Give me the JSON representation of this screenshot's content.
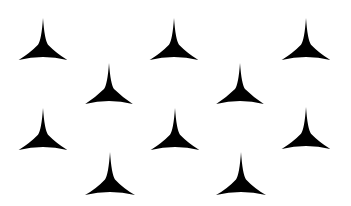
{
  "canvas": {
    "width": 351,
    "height": 206,
    "background": "#ffffff"
  },
  "shape": {
    "type": "three-pointed-star",
    "color": "#000000"
  },
  "stars": [
    {
      "cx": 43,
      "top": 18,
      "base": 60
    },
    {
      "cx": 174,
      "top": 18,
      "base": 60
    },
    {
      "cx": 306,
      "top": 18,
      "base": 60
    },
    {
      "cx": 109,
      "top": 63,
      "base": 104
    },
    {
      "cx": 240,
      "top": 63,
      "base": 104
    },
    {
      "cx": 43,
      "top": 108,
      "base": 150
    },
    {
      "cx": 175,
      "top": 108,
      "base": 150
    },
    {
      "cx": 306,
      "top": 107,
      "base": 149
    },
    {
      "cx": 110,
      "top": 152,
      "base": 195
    },
    {
      "cx": 241,
      "top": 152,
      "base": 195
    }
  ]
}
